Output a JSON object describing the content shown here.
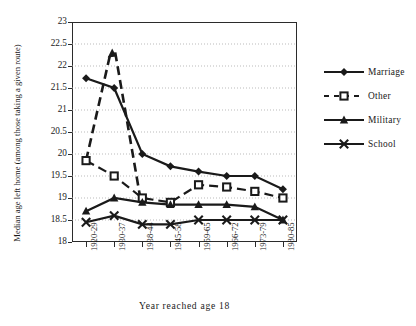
{
  "chart_data": {
    "type": "line",
    "title": "",
    "xlabel": "Year reached age 18",
    "ylabel": "Median age left home (among those taking a given route)",
    "categories": [
      "1920-29",
      "1930-37",
      "1938-44",
      "1945-58",
      "1959-65",
      "1966-72",
      "1973-79",
      "1980-85"
    ],
    "ylim": [
      18,
      23
    ],
    "yticks": [
      "18",
      "18.5",
      "19",
      "19.5",
      "20",
      "20.5",
      "21",
      "21.5",
      "22",
      "22.5",
      "23"
    ],
    "grid": true,
    "legend_position": "right",
    "series": [
      {
        "name": "Marriage",
        "marker": "diamond",
        "line": "solid",
        "values": [
          21.72,
          21.5,
          20.0,
          19.72,
          19.6,
          19.5,
          19.5,
          19.2
        ]
      },
      {
        "name": "Other",
        "marker": "square-open",
        "line": "dashed",
        "values": [
          19.85,
          19.5,
          19.0,
          18.9,
          19.3,
          19.25,
          19.15,
          19.0
        ]
      },
      {
        "name": "Military",
        "marker": "triangle",
        "line": "solid",
        "values": [
          18.7,
          19.0,
          18.9,
          18.85,
          18.85,
          18.85,
          18.8,
          18.5
        ]
      },
      {
        "name": "School",
        "marker": "cross",
        "line": "solid",
        "values": [
          18.45,
          18.6,
          18.4,
          18.4,
          18.5,
          18.5,
          18.5,
          18.5
        ]
      }
    ],
    "annotations": [
      {
        "text": "Other series peaks at 22.4 at 1930-37 before falling",
        "series": "Other",
        "x": "1930-37",
        "y": 22.4
      }
    ],
    "other_peak_value": 22.4,
    "colors": {
      "ink": "#1a1a1a",
      "axis": "#2b2b2b",
      "grid": "#aaaaaa"
    }
  },
  "legend": {
    "items": [
      {
        "label": "Marriage"
      },
      {
        "label": "Other"
      },
      {
        "label": "Military"
      },
      {
        "label": "School"
      }
    ]
  }
}
